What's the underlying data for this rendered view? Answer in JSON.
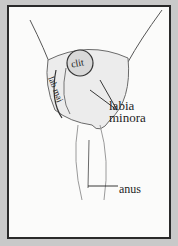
{
  "figure": {
    "type": "anatomical line illustration (schematic rendering)",
    "colors": {
      "page_background": "#c9c9c9",
      "panel_background": "#fbfbfa",
      "border": "#2a2a2a",
      "ink": "#1e1e1e",
      "shading": "#8a8a8a"
    }
  },
  "labels": {
    "clit": "clit",
    "lab_maj": "lab maj",
    "labia_minora_line1": "labia",
    "labia_minora_line2": "minora",
    "anus": "anus"
  }
}
